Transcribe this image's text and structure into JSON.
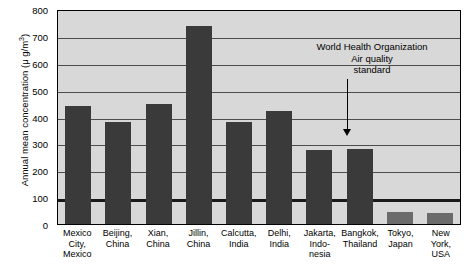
{
  "chart_data": {
    "type": "bar",
    "title": "",
    "xlabel": "",
    "ylabel_text": "Annual mean concentration (μ g/m",
    "ylabel_sup": "3",
    "ylabel_tail": ")",
    "ylim": [
      0,
      800
    ],
    "yticks": [
      0,
      100,
      200,
      300,
      400,
      500,
      600,
      700,
      800
    ],
    "grid": true,
    "legend": "none",
    "categories": [
      "Mexico City, Mexico",
      "Beijing, China",
      "Xian, China",
      "Jillin, China",
      "Calcutta, India",
      "Delhi, India",
      "Jakarta, Indonesia",
      "Bangkok, Thailand",
      "Tokyo, Japan",
      "New York, USA"
    ],
    "category_lines": [
      [
        "Mexico",
        "City,",
        "Mexico"
      ],
      [
        "Beijing,",
        "China"
      ],
      [
        "Xian,",
        "China"
      ],
      [
        "Jillin,",
        "China"
      ],
      [
        "Calcutta,",
        "India"
      ],
      [
        "Delhi,",
        "India"
      ],
      [
        "Jakarta,",
        "Indo-",
        "nesia"
      ],
      [
        "Bangkok,",
        "Thailand"
      ],
      [
        "Tokyo,",
        "Japan"
      ],
      [
        "New",
        "York,",
        "USA"
      ]
    ],
    "values": [
      440,
      380,
      445,
      735,
      380,
      420,
      275,
      280,
      45,
      40
    ],
    "annotations": [
      {
        "lines": [
          "World Health Organization",
          "Air quality",
          "standard"
        ],
        "points_to_value": 100
      }
    ],
    "reference_line": {
      "value": 100,
      "label": "World Health Organization Air quality standard"
    },
    "colors": {
      "bar": "#3a3a3a",
      "bar_below_standard": "#6b6b6b",
      "plot_background": "#d8d8d8",
      "gridline": "#4d4d4d",
      "reference_line": "#1a1a1a",
      "axis": "#000000",
      "text": "#000000"
    }
  }
}
